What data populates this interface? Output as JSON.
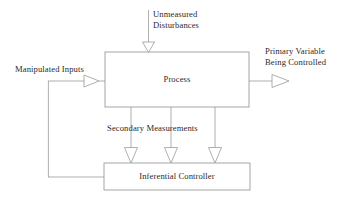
{
  "diagram": {
    "style": {
      "line_color": "#9a9a9a",
      "box_border_color": "#8f8f8f",
      "text_color": "#2b2b2b",
      "background": "#ffffff",
      "arrowhead": "open-triangle"
    },
    "blocks": [
      {
        "name": "process",
        "label": "Process",
        "x": 105,
        "y": 52,
        "width": 144,
        "height": 55
      },
      {
        "name": "inferential-controller",
        "label": "Inferential Controller",
        "x": 104,
        "y": 163,
        "width": 146,
        "height": 27
      }
    ],
    "signals": [
      {
        "name": "unmeasured-disturbances",
        "label_line_1": "Unmeasured",
        "label_line_2": "Disturbances",
        "direction": "down",
        "target": "process"
      },
      {
        "name": "manipulated-inputs",
        "label": "Manipulated Inputs",
        "direction": "right",
        "target": "process"
      },
      {
        "name": "primary-variable",
        "label_line_1": "Primary Variable",
        "label_line_2": "Being Controlled",
        "direction": "right",
        "source": "process"
      },
      {
        "name": "secondary-measurements",
        "label": "Secondary Measurements",
        "direction": "down",
        "source": "process",
        "target": "inferential-controller",
        "count": 3
      }
    ]
  },
  "labels": {
    "unmeasured_disturbances_1": "Unmeasured",
    "unmeasured_disturbances_2": "Disturbances",
    "primary_variable_1": "Primary Variable",
    "primary_variable_2": "Being Controlled",
    "manipulated_inputs": "Manipulated Inputs",
    "secondary_measurements": "Secondary Measurements",
    "process": "Process",
    "inferential_controller": "Inferential Controller"
  }
}
